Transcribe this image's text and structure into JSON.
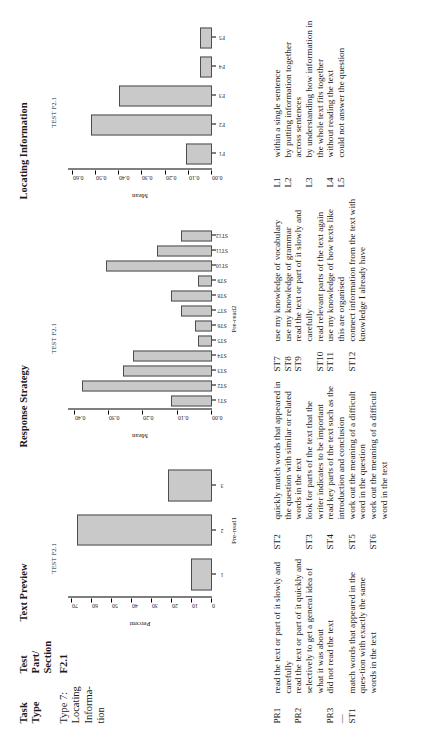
{
  "table_headers": {
    "task_type": "Task\nType",
    "test_part_section": "Test\nPart/\nSection",
    "text_preview": "Text Preview",
    "response_strategy": "Response Strategy",
    "locating_information": "Locating Information"
  },
  "row": {
    "task_type": "Type 7:\nLocating\nInforma-\ntion",
    "test_part_section": "F2.1"
  },
  "chart_data": [
    {
      "id": "text-preview",
      "type": "bar",
      "title": "Text Preview",
      "caption": "TEST F2.1",
      "categories": [
        "1",
        "2",
        "3"
      ],
      "values": [
        10.5,
        67.5,
        22.0
      ],
      "xlabel": "Pre-read1",
      "ylabel": "Percent",
      "yticks": [
        0,
        10,
        20,
        30,
        40,
        50,
        60,
        70
      ],
      "ytick_labels": [
        "0",
        "10",
        "20",
        "30",
        "40",
        "50",
        "60",
        "70"
      ],
      "ylim": [
        0,
        72
      ],
      "grid": false
    },
    {
      "id": "response-strategy",
      "type": "bar",
      "title": "Response Strategy",
      "caption": "TEST F2.1",
      "categories": [
        "ST1",
        "ST2",
        "ST3",
        "ST4",
        "ST5",
        "ST6",
        "ST7",
        "ST8",
        "ST9",
        "ST10",
        "ST11",
        "ST12"
      ],
      "values": [
        0.12,
        0.38,
        0.26,
        0.23,
        0.04,
        0.05,
        0.09,
        0.12,
        0.04,
        0.31,
        0.16,
        0.09
      ],
      "xlabel": "Pre-read2",
      "ylabel": "Mean",
      "yticks": [
        0.0,
        0.1,
        0.2,
        0.3,
        0.4
      ],
      "ytick_labels": [
        "0.00",
        "0.10",
        "0.20",
        "0.30",
        "0.40"
      ],
      "ylim": [
        0,
        0.42
      ],
      "grid": false
    },
    {
      "id": "locating-information",
      "type": "bar",
      "title": "Locating Information",
      "caption": "TEST F2.1",
      "categories": [
        "F1",
        "F2",
        "F3",
        "F4",
        "F5"
      ],
      "values": [
        0.11,
        0.52,
        0.4,
        0.05,
        0.05
      ],
      "xlabel": "",
      "ylabel": "Mean",
      "yticks": [
        0.0,
        0.1,
        0.2,
        0.3,
        0.4,
        0.5,
        0.6
      ],
      "ytick_labels": [
        "0.00",
        "0.10",
        "0.20",
        "0.30",
        "0.40",
        "0.50",
        "0.60"
      ],
      "ylim": [
        0,
        0.62
      ],
      "grid": false
    }
  ],
  "key": {
    "col1": [
      {
        "code": "PR1",
        "desc": "read the text or part of it slowly and carefully"
      },
      {
        "code": "PR2",
        "desc": "read the text or part of it quickly and selectively to get a general idea of what it was about"
      },
      {
        "code": "PR3",
        "desc": "did not read the text"
      },
      {
        "code": "—",
        "desc": ""
      },
      {
        "code": "ST1",
        "desc": "match words that appeared in the ques-tion with exactly the same words in the text"
      }
    ],
    "col2": [
      {
        "code": "ST2",
        "desc": "quickly match words that appeared in the question with similar or related words in the text"
      },
      {
        "code": "ST3",
        "desc": "look for parts of the text that the writer indicates to be important"
      },
      {
        "code": "ST4",
        "desc": "read key parts of the text such as the introduction and conclusion"
      },
      {
        "code": "ST5",
        "desc": "work out the meaning of a difficult word in the question"
      },
      {
        "code": "ST6",
        "desc": "work out the meaning of a difficult word in the text"
      }
    ],
    "col3": [
      {
        "code": "ST7",
        "desc": "use my knowledge of vocabulary"
      },
      {
        "code": "ST8",
        "desc": "use my knowledge of grammar"
      },
      {
        "code": "ST9",
        "desc": "read the text or part of it slowly and carefully"
      },
      {
        "code": "ST10",
        "desc": "read relevant parts of the text again"
      },
      {
        "code": "ST11",
        "desc": "use my knowledge of how texts like this are organised"
      },
      {
        "code": "ST12",
        "desc": "connect information from the text with knowledge I already have"
      }
    ],
    "col4": [
      {
        "code": "L1",
        "desc": "within a single sentence"
      },
      {
        "code": "L2",
        "desc": "by putting information together across sentences"
      },
      {
        "code": "L3",
        "desc": "by understanding how information in the whole text fits together"
      },
      {
        "code": "L4",
        "desc": "without reading the text"
      },
      {
        "code": "L5",
        "desc": "could not answer the question"
      }
    ]
  },
  "colors": {
    "bar_fill": "#c9c9c9",
    "bar_stroke": "#4d4d4d",
    "axis": "#000000",
    "text": "#1a1a1a"
  }
}
